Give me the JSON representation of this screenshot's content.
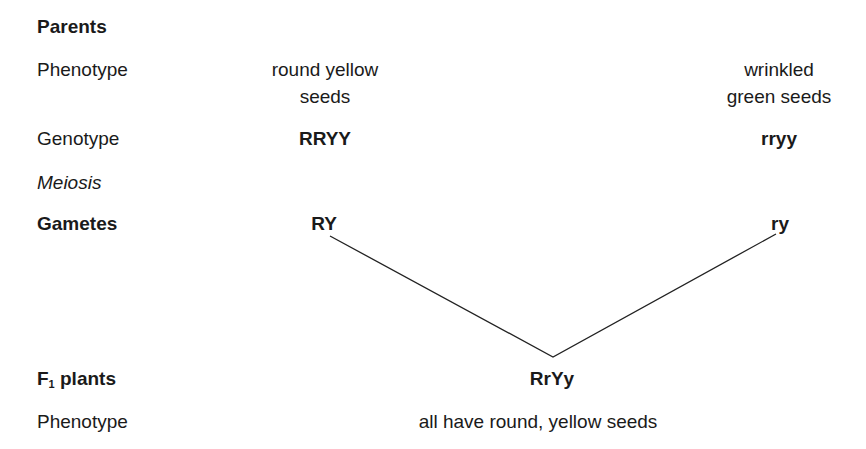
{
  "parents": {
    "heading": "Parents",
    "phenotype_label": "Phenotype",
    "left_phenotype_line1": "round yellow",
    "left_phenotype_line2": "seeds",
    "right_phenotype_line1": "wrinkled",
    "right_phenotype_line2": "green seeds",
    "genotype_label": "Genotype",
    "left_genotype": "RRYY",
    "right_genotype": "rryy"
  },
  "meiosis": {
    "label": "Meiosis"
  },
  "gametes": {
    "label": "Gametes",
    "left": "RY",
    "right": "ry"
  },
  "f1": {
    "label_prefix": "F",
    "label_subscript": "1",
    "label_suffix": " plants",
    "genotype": "RrYy",
    "phenotype_label": "Phenotype",
    "phenotype": "all have round, yellow seeds"
  },
  "lines": {
    "color": "#222222",
    "left_start": [
      330,
      236
    ],
    "join": [
      553,
      357
    ],
    "right_start": [
      776,
      234
    ]
  }
}
